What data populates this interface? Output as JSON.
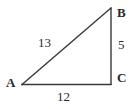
{
  "figure": {
    "name": "right-triangle",
    "background_color": "#ffffff",
    "stroke_color": "#3a3a3a",
    "text_color": "#2b2b2b",
    "stroke_width": 1.4
  },
  "vertices": [
    {
      "id": "A",
      "label": "A",
      "x": 22,
      "y": 84,
      "label_x": 6,
      "label_y": 76
    },
    {
      "id": "B",
      "label": "B",
      "x": 111,
      "y": 8,
      "label_x": 117,
      "label_y": 6
    },
    {
      "id": "C",
      "label": "C",
      "x": 111,
      "y": 84,
      "label_x": 117,
      "label_y": 71
    }
  ],
  "sides": [
    {
      "id": "AB",
      "name": "hypotenuse",
      "label": "13",
      "from": "A",
      "to": "B",
      "label_x": 38,
      "label_y": 36
    },
    {
      "id": "BC",
      "name": "vertical-leg",
      "label": "5",
      "from": "B",
      "to": "C",
      "label_x": 118,
      "label_y": 38
    },
    {
      "id": "AC",
      "name": "horizontal-leg",
      "label": "12",
      "from": "A",
      "to": "C",
      "label_x": 57,
      "label_y": 90
    }
  ],
  "chart_data": {
    "type": "diagram",
    "title": "",
    "shape": "right triangle",
    "points": {
      "A": [
        22,
        84
      ],
      "B": [
        111,
        8
      ],
      "C": [
        111,
        84
      ]
    },
    "edge_lengths": {
      "AB": 13,
      "BC": 5,
      "AC": 12
    },
    "right_angle_at": "C",
    "labels": [
      "A",
      "B",
      "C",
      "13",
      "5",
      "12"
    ]
  }
}
